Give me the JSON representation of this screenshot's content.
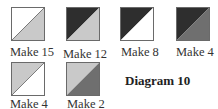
{
  "diagram": {
    "title": "Diagram 10",
    "colors": {
      "white": "#ffffff",
      "light": "#c9c9c9",
      "medium": "#6f6f6f",
      "dark": "#2e2e2e"
    },
    "blocks": [
      {
        "label": "Make 15",
        "upper_left": "white",
        "lower_right": "light"
      },
      {
        "label": "Make 12",
        "upper_left": "dark",
        "lower_right": "light"
      },
      {
        "label": "Make 8",
        "upper_left": "dark",
        "lower_right": "white"
      },
      {
        "label": "Make 4",
        "upper_left": "dark",
        "lower_right": "medium"
      },
      {
        "label": "Make 4",
        "upper_left": "light",
        "lower_right": "white"
      },
      {
        "label": "Make 2",
        "upper_left": "light",
        "lower_right": "medium"
      }
    ]
  }
}
